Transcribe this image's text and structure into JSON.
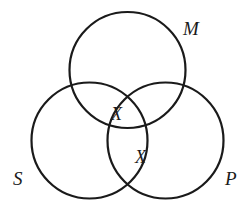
{
  "diagram": {
    "type": "venn-diagram",
    "sets": [
      {
        "id": "M",
        "label": "M"
      },
      {
        "id": "S",
        "label": "S"
      },
      {
        "id": "P",
        "label": "P"
      }
    ],
    "marks": [
      {
        "label": "X",
        "region": "S∩M boundary with P"
      },
      {
        "label": "X",
        "region": "S∩P boundary with M"
      }
    ],
    "stroke_color": "#1a1a1a",
    "background": "#ffffff"
  }
}
